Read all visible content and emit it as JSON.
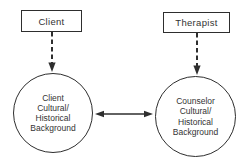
{
  "diagram": {
    "nodes": {
      "client_box": {
        "label": "Client"
      },
      "therapist_box": {
        "label": "Therapist"
      },
      "client_circle": {
        "label": "Client\nCultural/\nHistorical\nBackground"
      },
      "counselor_circle": {
        "label": "Counselor\nCultural/\nHistorical\nBackground"
      }
    },
    "connectors": {
      "client_to_circle": "dashed-arrow-down",
      "therapist_to_circle": "dashed-arrow-down",
      "circle_to_circle": "double-headed-arrow"
    },
    "colors": {
      "background": "#ffffff",
      "line": "#2e2e2e",
      "text": "#333333"
    }
  }
}
